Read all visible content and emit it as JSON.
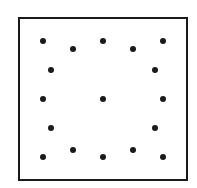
{
  "diagram": {
    "type": "dot-pattern",
    "frame": {
      "x": 18,
      "y": 17,
      "width": 170,
      "height": 164,
      "border_color": "#1a1a1a",
      "border_width": 2
    },
    "dot_color": "#1a1a1a",
    "dot_diameter": 6,
    "dot_count": 17,
    "dots": [
      {
        "x": 43,
        "y": 41
      },
      {
        "x": 73,
        "y": 49
      },
      {
        "x": 103,
        "y": 41
      },
      {
        "x": 133,
        "y": 49
      },
      {
        "x": 163,
        "y": 41
      },
      {
        "x": 51,
        "y": 70
      },
      {
        "x": 155,
        "y": 70
      },
      {
        "x": 43,
        "y": 99
      },
      {
        "x": 103,
        "y": 99
      },
      {
        "x": 163,
        "y": 99
      },
      {
        "x": 51,
        "y": 128
      },
      {
        "x": 155,
        "y": 128
      },
      {
        "x": 43,
        "y": 157
      },
      {
        "x": 73,
        "y": 150
      },
      {
        "x": 103,
        "y": 157
      },
      {
        "x": 133,
        "y": 150
      },
      {
        "x": 163,
        "y": 157
      }
    ]
  }
}
